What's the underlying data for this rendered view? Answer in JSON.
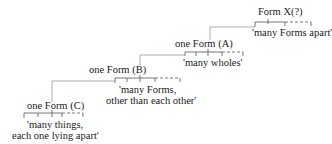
{
  "diagram": {
    "nodes": [
      {
        "id": "X",
        "label": "Form X(?)",
        "gloss": "'many Forms apart'"
      },
      {
        "id": "A",
        "label": "one Form (A)",
        "gloss": "'many wholes'"
      },
      {
        "id": "B",
        "label": "one Form (B)",
        "gloss_line1": "'many Forms,",
        "gloss_line2": "other than each other'"
      },
      {
        "id": "C",
        "label": "one Form (C)",
        "gloss_line1": "'many things,",
        "gloss_line2": "each one lying apart'"
      }
    ],
    "edges": [
      {
        "from": "X",
        "to": "A"
      },
      {
        "from": "A",
        "to": "B"
      },
      {
        "from": "B",
        "to": "C"
      }
    ],
    "colors": {
      "text": "#1a1a1a",
      "line": "#555555",
      "connector": "#999999"
    }
  }
}
